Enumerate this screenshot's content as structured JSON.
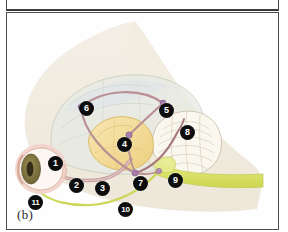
{
  "figure": {
    "caption": "(b)",
    "panel_label": "b",
    "background_color": "#fefefe",
    "frame_color": "#4f4f4f"
  },
  "palette": {
    "head_silhouette": "#efe9dd",
    "cerebrum": "#e4e9e2",
    "cerebrum_outline": "#b9c3b4",
    "cerebellum": "#f7f4ec",
    "cerebellum_outline": "#c8bfa8",
    "thalamus": "#f2da9a",
    "thalamus_outline": "#d9b963",
    "pathway_rose": "#bc8f93",
    "pathway_rose_light": "#d3aeb0",
    "synapse_node": "#a071a8",
    "nerve_yellow_green": "#d8e063",
    "nerve_yellow_green_dark": "#b9c44a",
    "eye_outer": "#f0cfc6",
    "eye_sclera": "#fbf6f2",
    "iris": "#857a45",
    "pupil": "#3a3220",
    "callout_fill": "#0d0d0d",
    "callout_text": "#ffffff"
  },
  "anatomy_regions": [
    {
      "name": "head-silhouette",
      "label": "Head outline"
    },
    {
      "name": "cerebrum",
      "label": "Cerebrum"
    },
    {
      "name": "cerebellum",
      "label": "Cerebellum"
    },
    {
      "name": "thalamus",
      "label": "Thalamus / midbrain"
    },
    {
      "name": "eye",
      "label": "Eye"
    },
    {
      "name": "spinal-cord",
      "label": "Spinal cord"
    }
  ],
  "callouts": [
    {
      "id": "1",
      "label": "1",
      "x": 41,
      "y": 143,
      "target": "eye"
    },
    {
      "id": "2",
      "label": "2",
      "x": 62,
      "y": 165,
      "target": "optic-nerve"
    },
    {
      "id": "3",
      "label": "3",
      "x": 88,
      "y": 168,
      "target": "optic-tract"
    },
    {
      "id": "4",
      "label": "4",
      "x": 110,
      "y": 124,
      "target": "thalamus"
    },
    {
      "id": "5",
      "label": "5",
      "x": 152,
      "y": 90,
      "target": "cortex-posterior"
    },
    {
      "id": "6",
      "label": "6",
      "x": 72,
      "y": 88,
      "target": "cortex-anterior"
    },
    {
      "id": "7",
      "label": "7",
      "x": 126,
      "y": 163,
      "target": "brainstem"
    },
    {
      "id": "8",
      "label": "8",
      "x": 173,
      "y": 112,
      "target": "cerebellum"
    },
    {
      "id": "9",
      "label": "9",
      "x": 161,
      "y": 160,
      "target": "spinal-cord-upper"
    },
    {
      "id": "10",
      "label": "10",
      "x": 111,
      "y": 189,
      "target": "peripheral-nerve"
    },
    {
      "id": "11",
      "label": "11",
      "x": 21,
      "y": 182,
      "target": "eye-inferior"
    }
  ]
}
